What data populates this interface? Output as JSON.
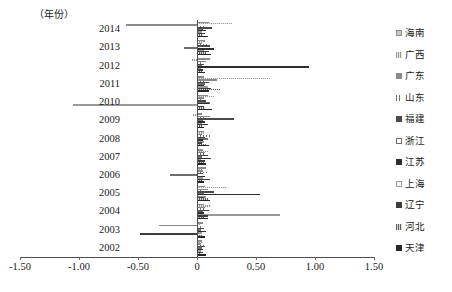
{
  "chart": {
    "type": "bar",
    "orientation": "horizontal",
    "yaxis_title": "（年份）",
    "background": "#ffffff"
  },
  "chart_data": {
    "type": "bar",
    "title": "",
    "xlabel": "",
    "ylabel": "（年份）",
    "orientation": "horizontal",
    "grid": false,
    "legend_position": "right",
    "xlim": [
      -1.5,
      1.5
    ],
    "xticks": [
      "-1.50",
      "-1.00",
      "-0.50",
      "0",
      "0.50",
      "1.00",
      "1.50"
    ],
    "xtick_values": [
      -1.5,
      -1.0,
      -0.5,
      0,
      0.5,
      1.0,
      1.5
    ],
    "categories": [
      "2014",
      "2013",
      "2012",
      "2011",
      "2010",
      "2009",
      "2008",
      "2007",
      "2006",
      "2005",
      "2004",
      "2003",
      "2002"
    ],
    "series": [
      {
        "name": "海南",
        "values": [
          0.1,
          0.07,
          0.11,
          0.06,
          0.09,
          0.04,
          0.06,
          0.05,
          0.08,
          0.07,
          0.06,
          0.05,
          0.04
        ]
      },
      {
        "name": "广西",
        "values": [
          0.3,
          0.05,
          -0.04,
          0.62,
          0.14,
          -0.03,
          0.06,
          0.1,
          0.04,
          0.25,
          0.12,
          0.03,
          0.05
        ]
      },
      {
        "name": "广东",
        "values": [
          -0.6,
          0.04,
          0.08,
          0.17,
          0.06,
          0.11,
          0.04,
          0.07,
          0.05,
          0.09,
          0.07,
          -0.32,
          0.03
        ]
      },
      {
        "name": "山东",
        "values": [
          0.06,
          0.09,
          0.05,
          0.08,
          0.04,
          0.07,
          0.12,
          0.06,
          0.1,
          0.05,
          0.08,
          0.04,
          0.06
        ]
      },
      {
        "name": "福建",
        "values": [
          0.13,
          0.11,
          0.06,
          0.1,
          0.08,
          0.31,
          0.07,
          0.09,
          0.05,
          0.14,
          0.1,
          0.06,
          0.07
        ]
      },
      {
        "name": "浙江",
        "values": [
          0.05,
          -0.11,
          0.04,
          0.07,
          0.11,
          0.05,
          0.09,
          0.04,
          -0.23,
          0.06,
          0.05,
          0.03,
          0.04
        ]
      },
      {
        "name": "江苏",
        "values": [
          0.08,
          0.14,
          0.95,
          0.06,
          0.1,
          0.07,
          0.05,
          0.12,
          0.07,
          0.53,
          0.06,
          0.08,
          0.05
        ]
      },
      {
        "name": "上海",
        "values": [
          0.04,
          0.06,
          0.03,
          0.09,
          -1.05,
          0.04,
          0.06,
          0.03,
          0.05,
          0.08,
          0.7,
          0.04,
          0.03
        ]
      },
      {
        "name": "辽宁",
        "values": [
          0.07,
          0.1,
          0.05,
          0.12,
          0.06,
          0.09,
          0.04,
          0.07,
          0.11,
          0.06,
          0.09,
          -0.48,
          0.05
        ]
      },
      {
        "name": "河北",
        "values": [
          0.05,
          0.08,
          0.04,
          0.2,
          0.07,
          0.05,
          0.08,
          0.06,
          0.04,
          0.09,
          0.06,
          0.05,
          0.03
        ]
      },
      {
        "name": "天津",
        "values": [
          0.09,
          0.12,
          0.07,
          0.1,
          0.13,
          0.06,
          0.1,
          0.08,
          0.06,
          0.11,
          0.09,
          0.07,
          0.08
        ]
      }
    ]
  },
  "legend": {
    "items": [
      {
        "label": "海南",
        "swatch": "s0"
      },
      {
        "label": "广西",
        "swatch": "s1"
      },
      {
        "label": "广东",
        "swatch": "s2"
      },
      {
        "label": "山东",
        "swatch": "s3"
      },
      {
        "label": "福建",
        "swatch": "s4"
      },
      {
        "label": "浙江",
        "swatch": "s5"
      },
      {
        "label": "江苏",
        "swatch": "s6"
      },
      {
        "label": "上海",
        "swatch": "s7"
      },
      {
        "label": "辽宁",
        "swatch": "s8"
      },
      {
        "label": "河北",
        "swatch": "s9"
      },
      {
        "label": "天津",
        "swatch": "s10"
      }
    ]
  }
}
